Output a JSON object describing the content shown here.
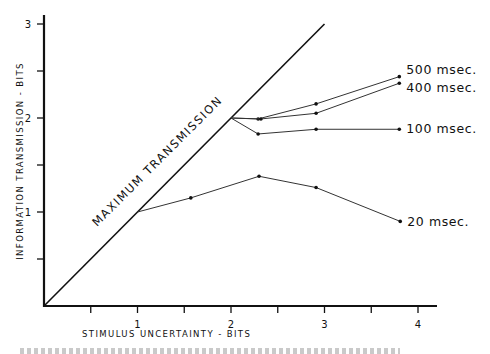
{
  "chart_data": {
    "type": "line",
    "title": "",
    "xlabel": "STIMULUS UNCERTAINTY - BITS",
    "ylabel": "INFORMATION TRANSMISSION - BITS",
    "xlim": [
      0,
      4.2
    ],
    "ylim": [
      0,
      3.1
    ],
    "grid": false,
    "x_ticks": [
      {
        "value": 0.5,
        "label": ""
      },
      {
        "value": 1,
        "label": "1"
      },
      {
        "value": 1.5,
        "label": ""
      },
      {
        "value": 2,
        "label": "2"
      },
      {
        "value": 2.5,
        "label": ""
      },
      {
        "value": 3,
        "label": "3"
      },
      {
        "value": 3.5,
        "label": ""
      },
      {
        "value": 4,
        "label": "4"
      }
    ],
    "y_ticks": [
      {
        "value": 0.5,
        "label": ""
      },
      {
        "value": 1,
        "label": "1"
      },
      {
        "value": 1.5,
        "label": ""
      },
      {
        "value": 2,
        "label": "2"
      },
      {
        "value": 2.5,
        "label": ""
      },
      {
        "value": 3,
        "label": "3"
      }
    ],
    "reference_line": {
      "name": "MAXIMUM TRANSMISSION",
      "x": [
        0,
        3
      ],
      "y": [
        0,
        3
      ]
    },
    "series": [
      {
        "name": "500 msec.",
        "x": [
          2.0,
          2.29,
          2.91,
          3.8
        ],
        "y": [
          2.0,
          1.99,
          2.15,
          2.44
        ]
      },
      {
        "name": "400 msec.",
        "x": [
          2.0,
          2.32,
          2.91,
          3.8
        ],
        "y": [
          2.0,
          1.99,
          2.05,
          2.37
        ]
      },
      {
        "name": "100 msec.",
        "x": [
          2.0,
          2.29,
          2.91,
          3.8
        ],
        "y": [
          2.0,
          1.83,
          1.88,
          1.88
        ]
      },
      {
        "name": "20 msec.",
        "x": [
          1.0,
          1.57,
          2.3,
          2.91,
          3.81
        ],
        "y": [
          1.0,
          1.15,
          1.38,
          1.26,
          0.9
        ]
      }
    ],
    "legend": "inline-right-of-line-ends"
  }
}
